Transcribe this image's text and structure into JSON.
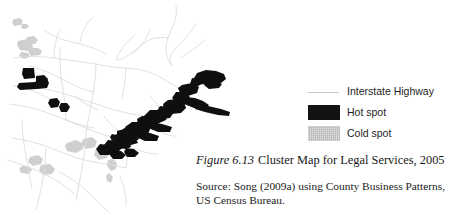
{
  "figure": {
    "number_label": "Figure 6.13",
    "title": "Cluster Map for Legal Services, 2005",
    "source_line_1": "Source: Song (2009a) using County Business Patterns,",
    "source_line_2": "US Census Bureau."
  },
  "legend": {
    "items": [
      {
        "key": "interstate-highway",
        "label": "Interstate Highway",
        "swatch": "line",
        "color": "#c9c9c9"
      },
      {
        "key": "hot-spot",
        "label": "Hot spot",
        "swatch": "box-hot",
        "color": "#121212"
      },
      {
        "key": "cold-spot",
        "label": "Cold spot",
        "swatch": "box-cold",
        "color": "#b6b6b6"
      }
    ]
  },
  "map": {
    "region_description": "Northeastern United States",
    "background_color": "#ffffff",
    "highway_color": "#dcdcdc",
    "hot_spot_color": "#0f0f0f",
    "cold_spot_color": "#cccccc",
    "hot_spot_clusters": [
      "Boston–New York–Philadelphia–Baltimore–Washington corridor",
      "Chicago metropolitan area",
      "Detroit / Cleveland area",
      "Washington DC / Northern Virginia"
    ],
    "cold_spot_clusters": [
      "Central Appalachia",
      "Southern interior counties",
      "Upper Midwest rural counties"
    ]
  }
}
